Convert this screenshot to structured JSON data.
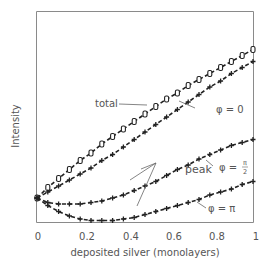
{
  "chart_data": {
    "type": "line",
    "title": "",
    "xlabel": "deposited silver (monolayers)",
    "ylabel": "Intensity",
    "xlim": [
      0,
      1
    ],
    "ylim": [
      -0.16,
      1.25
    ],
    "x_ticks": [
      "0",
      "0.2",
      "0.4",
      "0.6",
      "0.8",
      "1"
    ],
    "y_ticks": [],
    "grid": false,
    "legend": "inline annotations",
    "x": [
      0,
      0.05,
      0.1,
      0.15,
      0.2,
      0.25,
      0.3,
      0.35,
      0.4,
      0.45,
      0.5,
      0.55,
      0.6,
      0.65,
      0.7,
      0.75,
      0.8,
      0.85,
      0.9,
      0.95,
      1.0
    ],
    "series": [
      {
        "name": "total",
        "marker": "0",
        "values": [
          0,
          0.07,
          0.13,
          0.19,
          0.25,
          0.3,
          0.36,
          0.41,
          0.46,
          0.51,
          0.56,
          0.61,
          0.66,
          0.7,
          0.75,
          0.79,
          0.83,
          0.87,
          0.91,
          0.95,
          0.99
        ]
      },
      {
        "name": "peak φ = 0",
        "marker": "+",
        "values": [
          0,
          0.04,
          0.08,
          0.12,
          0.16,
          0.2,
          0.25,
          0.29,
          0.34,
          0.39,
          0.44,
          0.49,
          0.54,
          0.59,
          0.64,
          0.69,
          0.74,
          0.78,
          0.83,
          0.87,
          0.91
        ]
      },
      {
        "name": "peak φ = π/2",
        "marker": "+",
        "values": [
          0,
          -0.03,
          -0.04,
          -0.04,
          -0.04,
          -0.03,
          -0.02,
          0,
          0.02,
          0.05,
          0.08,
          0.11,
          0.15,
          0.19,
          0.22,
          0.26,
          0.29,
          0.32,
          0.35,
          0.37,
          0.39
        ]
      },
      {
        "name": "peak φ = π",
        "marker": "+",
        "values": [
          0,
          -0.05,
          -0.09,
          -0.12,
          -0.14,
          -0.15,
          -0.15,
          -0.15,
          -0.14,
          -0.13,
          -0.11,
          -0.09,
          -0.07,
          -0.05,
          -0.03,
          -0.01,
          0.02,
          0.04,
          0.06,
          0.09,
          0.11
        ]
      }
    ],
    "annotations": [
      {
        "text": "total",
        "points_to": "total"
      },
      {
        "text": "φ = 0",
        "points_to": "peak φ = 0"
      },
      {
        "text": "peak",
        "points_to": [
          "peak φ = 0",
          "peak φ = π/2",
          "peak φ = π"
        ]
      },
      {
        "text": "φ = π/2",
        "points_to": "peak φ = π/2"
      },
      {
        "text": "φ = π",
        "points_to": "peak φ = π"
      }
    ]
  },
  "labels": {
    "ylabel": "Intensity",
    "xlabel": "deposited silver (monolayers)",
    "total": "total",
    "peak": "peak",
    "phi0": "φ = 0",
    "phi_half_prefix": "φ =",
    "phi_half_num": "π",
    "phi_half_den": "2",
    "phi_pi": "φ = π",
    "xticks": [
      "0",
      "0.2",
      "0.4",
      "0.6",
      "0.8",
      "1"
    ]
  },
  "style": {
    "frame_color": "#8a8a8a",
    "curve_color": "#222222",
    "text_color": "#555555"
  }
}
